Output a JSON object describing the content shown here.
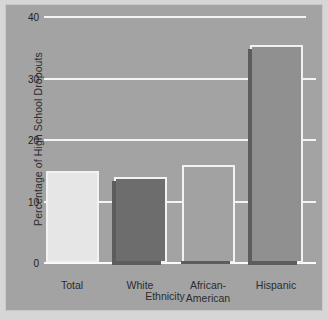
{
  "chart_data": {
    "type": "bar",
    "title": "",
    "xlabel": "Ethnicity",
    "ylabel": "Percentage of High School Dropouts",
    "categories": [
      "Total",
      "White",
      "African-\nAmerican",
      "Hispanic"
    ],
    "values": [
      15,
      14,
      16,
      35.5
    ],
    "ylim": [
      0,
      40
    ],
    "yticks": [
      0,
      10,
      20,
      30,
      40
    ],
    "ytick_labels": [
      "0",
      "10",
      "20",
      "30",
      "40"
    ],
    "grid": "horizontal-white-gridlines",
    "legend": "none",
    "bar_colors": [
      "#e6e6e6",
      "#6d6d6d",
      "#a2a2a2",
      "#909090"
    ],
    "bar_edge_color": "#f2f2f2",
    "background_color": "#a3a3a3",
    "series": [
      {
        "name": "Percentage of High School Dropouts",
        "points": [
          {
            "category": "Total",
            "value": 15
          },
          {
            "category": "White",
            "value": 14
          },
          {
            "category": "African-American",
            "value": 16
          },
          {
            "category": "Hispanic",
            "value": 35.5
          }
        ]
      }
    ]
  }
}
